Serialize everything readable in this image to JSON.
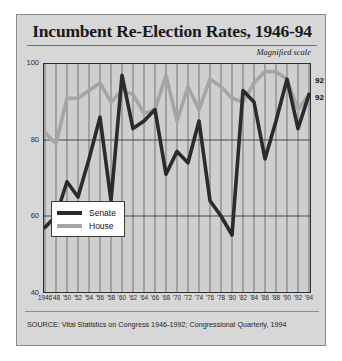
{
  "card": {
    "title": "Incumbent Re-Election Rates, 1946-94",
    "annotation": "Magnified scale",
    "source": "SOURCE: Vital Statistics on Congress 1946-1992; Congressional Quarterly, 1994"
  },
  "legend": {
    "senate_label": "Senate",
    "house_label": "House",
    "senate_color": "#2b2b2b",
    "house_color": "#a5a5a5"
  },
  "end_labels": {
    "house": "92",
    "senate": "92"
  },
  "chart_data": {
    "type": "line",
    "title": "Incumbent Re-Election Rates, 1946-94",
    "subtitle": "Magnified scale",
    "xlabel": "",
    "ylabel": "",
    "ylim": [
      40,
      100
    ],
    "yticks": [
      100,
      80,
      60,
      40
    ],
    "ytick_labels": [
      "100",
      "80",
      "60",
      "40"
    ],
    "grid": {
      "vertical": true,
      "horizontal_at": [
        80,
        60
      ]
    },
    "legend_position": "inside-bottom-left",
    "x": [
      1946,
      1948,
      1950,
      1952,
      1954,
      1956,
      1958,
      1960,
      1962,
      1964,
      1966,
      1968,
      1970,
      1972,
      1974,
      1976,
      1978,
      1980,
      1982,
      1984,
      1986,
      1988,
      1990,
      1992,
      1994
    ],
    "categories": [
      "1946",
      "'48",
      "'50",
      "'52",
      "'54",
      "'56",
      "'58",
      "'60",
      "'62",
      "'64",
      "'66",
      "'68",
      "'70",
      "'72",
      "'74",
      "'76",
      "'78",
      "'80",
      "'82",
      "'84",
      "'86",
      "'88",
      "'90",
      "'92",
      "'94"
    ],
    "series": [
      {
        "name": "Senate",
        "color": "#2b2b2b",
        "values": [
          57,
          60,
          69,
          65,
          75,
          86,
          64,
          97,
          83,
          85,
          88,
          71,
          77,
          74,
          85,
          64,
          60,
          55,
          93,
          90,
          75,
          85,
          96,
          83,
          92
        ]
      },
      {
        "name": "House",
        "color": "#a5a5a5",
        "values": [
          82,
          79,
          91,
          91,
          93,
          95,
          90,
          93,
          92,
          87,
          88,
          97,
          85,
          94,
          88,
          96,
          94,
          91,
          90,
          95,
          98,
          98,
          96,
          88,
          92
        ]
      }
    ],
    "annotations": [
      {
        "text": "92",
        "series": "House",
        "x": 1994
      },
      {
        "text": "92",
        "series": "Senate",
        "x": 1994
      }
    ]
  }
}
